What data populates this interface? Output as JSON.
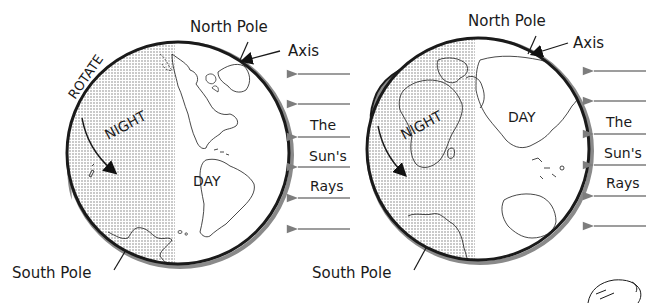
{
  "diagram": {
    "colors": {
      "background": "#ffffff",
      "outline": "#1a1a1a",
      "rim_shadow": "#8a8a8a",
      "night_dots": "#7a7a7a",
      "ray_arrow": "#7d7d7d"
    },
    "left_globe": {
      "north_pole_label": "North Pole",
      "axis_label": "Axis",
      "rotate_label": "ROTATE",
      "night_label": "NIGHT",
      "day_label": "DAY",
      "south_pole_label": "South Pole",
      "continents_visible": [
        "North America",
        "South America",
        "Antarctica"
      ]
    },
    "right_globe": {
      "north_pole_label": "North Pole",
      "axis_label": "Axis",
      "night_label": "NIGHT",
      "day_label": "DAY",
      "south_pole_label": "South Pole",
      "continents_visible": [
        "Africa",
        "Europe",
        "Asia",
        "Australia",
        "Antarctica"
      ]
    },
    "sun_rays": {
      "line1": "The",
      "line2": "Sun's",
      "line3": "Rays",
      "arrow_count": 6,
      "direction": "right-to-left"
    }
  }
}
